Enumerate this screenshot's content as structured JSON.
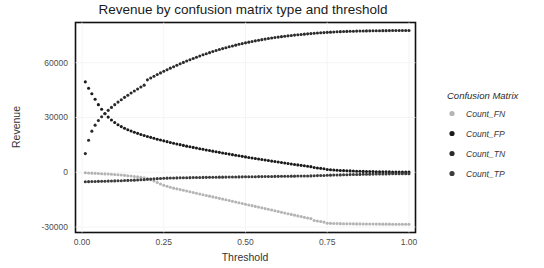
{
  "chart_data": {
    "type": "scatter",
    "title": "Revenue by confusion matrix type and threshold",
    "xlabel": "Threshold",
    "ylabel": "Revenue",
    "xlim": [
      -0.02,
      1.02
    ],
    "ylim": [
      -33000,
      82000
    ],
    "xticks": [
      0.0,
      0.25,
      0.5,
      0.75,
      1.0
    ],
    "xticklabels": [
      "0.00",
      "0.25",
      "0.50",
      "0.75",
      "1.00"
    ],
    "yticks": [
      -30000,
      0,
      30000,
      60000
    ],
    "yticklabels": [
      "-30000",
      "0",
      "30000",
      "60000"
    ],
    "grid": true,
    "legend_position": "right",
    "legend_title": "Confusion Matrix",
    "x": [
      0.01,
      0.02,
      0.03,
      0.04,
      0.05,
      0.06,
      0.07,
      0.08,
      0.09,
      0.1,
      0.11,
      0.12,
      0.13,
      0.14,
      0.15,
      0.16,
      0.17,
      0.18,
      0.19,
      0.2,
      0.21,
      0.22,
      0.23,
      0.24,
      0.25,
      0.26,
      0.27,
      0.28,
      0.29,
      0.3,
      0.31,
      0.32,
      0.33,
      0.34,
      0.35,
      0.36,
      0.37,
      0.38,
      0.39,
      0.4,
      0.41,
      0.42,
      0.43,
      0.44,
      0.45,
      0.46,
      0.47,
      0.48,
      0.49,
      0.5,
      0.51,
      0.52,
      0.53,
      0.54,
      0.55,
      0.56,
      0.57,
      0.58,
      0.59,
      0.6,
      0.61,
      0.62,
      0.63,
      0.64,
      0.65,
      0.66,
      0.67,
      0.68,
      0.69,
      0.7,
      0.71,
      0.72,
      0.73,
      0.74,
      0.75,
      0.76,
      0.77,
      0.78,
      0.79,
      0.8,
      0.81,
      0.82,
      0.83,
      0.84,
      0.85,
      0.86,
      0.87,
      0.88,
      0.89,
      0.9,
      0.91,
      0.92,
      0.93,
      0.94,
      0.95,
      0.96,
      0.97,
      0.98,
      0.99,
      1.0
    ],
    "series": [
      {
        "name": "Count_FN",
        "color": "#b4b4b4",
        "values": [
          -300,
          -400,
          -500,
          -600,
          -700,
          -800,
          -900,
          -1000,
          -1100,
          -1250,
          -1400,
          -1550,
          -1700,
          -1900,
          -2100,
          -2300,
          -2550,
          -2800,
          -3100,
          -3500,
          -4100,
          -4800,
          -5600,
          -6400,
          -7100,
          -7700,
          -8200,
          -8700,
          -9100,
          -9500,
          -9900,
          -10300,
          -10700,
          -11100,
          -11500,
          -11900,
          -12300,
          -12700,
          -13100,
          -13500,
          -13900,
          -14300,
          -14700,
          -15100,
          -15500,
          -15900,
          -16300,
          -16700,
          -17100,
          -17500,
          -17900,
          -18300,
          -18700,
          -19100,
          -19500,
          -19900,
          -20300,
          -20700,
          -21100,
          -21500,
          -21900,
          -22300,
          -22700,
          -23100,
          -23500,
          -23900,
          -24300,
          -24700,
          -25100,
          -25400,
          -26400,
          -26700,
          -27000,
          -27300,
          -27900,
          -28000,
          -28050,
          -28100,
          -28150,
          -28200,
          -28220,
          -28240,
          -28260,
          -28280,
          -28300,
          -28320,
          -28340,
          -28360,
          -28380,
          -28400,
          -28410,
          -28420,
          -28430,
          -28440,
          -28450,
          -28460,
          -28470,
          -28480,
          -28490,
          -28500
        ]
      },
      {
        "name": "Count_FP",
        "color": "#1a1a1a",
        "values": [
          49500,
          46000,
          43000,
          40000,
          37000,
          34500,
          32000,
          30200,
          28600,
          27200,
          26000,
          25000,
          24100,
          23300,
          22600,
          21900,
          21300,
          20700,
          20100,
          19600,
          19100,
          18600,
          18100,
          17650,
          17200,
          16750,
          16300,
          15900,
          15500,
          15100,
          14700,
          14300,
          13950,
          13600,
          13250,
          12900,
          12550,
          12200,
          11870,
          11540,
          11210,
          10880,
          10560,
          10240,
          9930,
          9620,
          9310,
          9000,
          8700,
          8400,
          8100,
          7810,
          7520,
          7230,
          6950,
          6670,
          6390,
          6110,
          5840,
          5570,
          5300,
          5040,
          4780,
          4520,
          4270,
          4020,
          3770,
          3530,
          3290,
          3050,
          2600,
          2350,
          2120,
          1900,
          1500,
          1350,
          1220,
          1100,
          990,
          890,
          800,
          720,
          650,
          580,
          520,
          470,
          420,
          380,
          340,
          300,
          270,
          240,
          215,
          190,
          170,
          150,
          130,
          115,
          100,
          90
        ]
      },
      {
        "name": "Count_TN",
        "color": "#2b2b2b",
        "values": [
          10200,
          17500,
          22500,
          25800,
          28300,
          30400,
          32200,
          33900,
          35500,
          37000,
          38400,
          39700,
          41000,
          42200,
          43400,
          44500,
          45600,
          46700,
          47700,
          50600,
          51600,
          52600,
          53500,
          54400,
          55300,
          56150,
          57000,
          57800,
          58600,
          59400,
          60150,
          60900,
          61600,
          62300,
          63000,
          63650,
          64300,
          64900,
          65500,
          66100,
          66650,
          67200,
          67700,
          68200,
          68700,
          69150,
          69600,
          70050,
          70450,
          70850,
          71250,
          71600,
          71950,
          72300,
          72600,
          72900,
          73200,
          73480,
          73750,
          74000,
          74250,
          74480,
          74700,
          74900,
          75100,
          75280,
          75450,
          75620,
          75780,
          75930,
          76080,
          76220,
          76350,
          76480,
          76600,
          76710,
          76810,
          76900,
          76980,
          77050,
          77120,
          77180,
          77230,
          77280,
          77320,
          77360,
          77400,
          77430,
          77460,
          77490,
          77510,
          77530,
          77550,
          77570,
          77590,
          77600,
          77610,
          77620,
          77630,
          77640
        ]
      },
      {
        "name": "Count_TP",
        "color": "#3c3c3c",
        "values": [
          -5200,
          -5150,
          -5100,
          -5050,
          -5000,
          -4950,
          -4900,
          -4850,
          -4800,
          -4740,
          -4680,
          -4620,
          -4550,
          -4480,
          -4400,
          -4320,
          -4240,
          -4150,
          -4050,
          -3900,
          -3750,
          -3620,
          -3500,
          -3400,
          -3320,
          -3250,
          -3190,
          -3140,
          -3090,
          -3050,
          -3010,
          -2980,
          -2950,
          -2920,
          -2890,
          -2860,
          -2830,
          -2800,
          -2780,
          -2750,
          -2730,
          -2700,
          -2680,
          -2650,
          -2630,
          -2600,
          -2580,
          -2550,
          -2530,
          -2500,
          -2480,
          -2450,
          -2430,
          -2400,
          -2380,
          -2350,
          -2330,
          -2300,
          -2280,
          -2250,
          -2230,
          -2200,
          -2180,
          -2150,
          -2130,
          -2100,
          -2080,
          -2050,
          -2020,
          -2000,
          -1900,
          -1850,
          -1800,
          -1750,
          -1650,
          -1600,
          -1550,
          -1500,
          -1450,
          -1400,
          -1350,
          -1300,
          -1260,
          -1220,
          -1180,
          -1140,
          -1100,
          -1060,
          -1030,
          -1000,
          -970,
          -940,
          -910,
          -880,
          -860,
          -840,
          -820,
          -800,
          -780,
          -760
        ]
      }
    ]
  },
  "legend": {
    "title": "Confusion Matrix",
    "items": [
      {
        "label": "Count_FN",
        "color": "#b4b4b4"
      },
      {
        "label": "Count_FP",
        "color": "#1a1a1a"
      },
      {
        "label": "Count_TN",
        "color": "#2b2b2b"
      },
      {
        "label": "Count_TP",
        "color": "#3c3c3c"
      }
    ]
  }
}
